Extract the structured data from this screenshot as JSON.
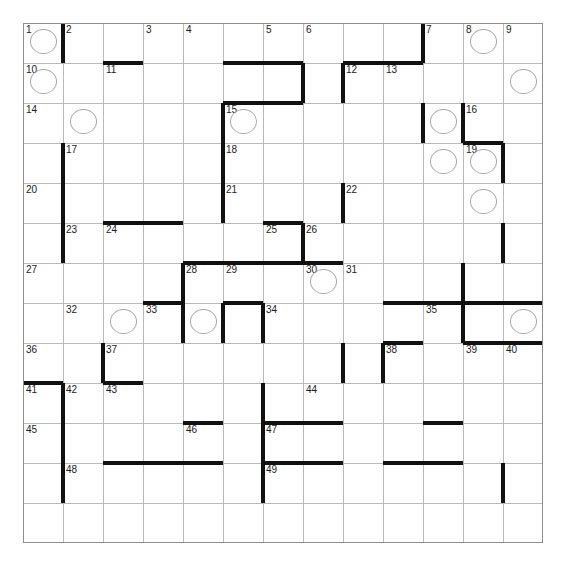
{
  "page": {
    "top_clipped_text": ""
  },
  "grid": {
    "columns": 13,
    "rows": 13,
    "cell_size": 40,
    "origin_x": 23,
    "origin_y": 23,
    "line_color": "#b9b9b9",
    "border_color": "#8d8d8d",
    "wall_color": "#111111",
    "circle_color": "#a8a8a8",
    "number_color": "#1a1a1a",
    "background": "#ffffff"
  },
  "numbers": [
    {
      "n": "1",
      "col": 0,
      "row": 0
    },
    {
      "n": "2",
      "col": 1,
      "row": 0
    },
    {
      "n": "3",
      "col": 3,
      "row": 0
    },
    {
      "n": "4",
      "col": 4,
      "row": 0
    },
    {
      "n": "5",
      "col": 6,
      "row": 0
    },
    {
      "n": "6",
      "col": 7,
      "row": 0
    },
    {
      "n": "7",
      "col": 10,
      "row": 0
    },
    {
      "n": "8",
      "col": 11,
      "row": 0
    },
    {
      "n": "9",
      "col": 12,
      "row": 0
    },
    {
      "n": "10",
      "col": 0,
      "row": 1
    },
    {
      "n": "11",
      "col": 2,
      "row": 1
    },
    {
      "n": "12",
      "col": 8,
      "row": 1
    },
    {
      "n": "13",
      "col": 9,
      "row": 1
    },
    {
      "n": "14",
      "col": 0,
      "row": 2
    },
    {
      "n": "15",
      "col": 5,
      "row": 2
    },
    {
      "n": "16",
      "col": 11,
      "row": 2
    },
    {
      "n": "17",
      "col": 1,
      "row": 3
    },
    {
      "n": "18",
      "col": 5,
      "row": 3
    },
    {
      "n": "19",
      "col": 11,
      "row": 3
    },
    {
      "n": "20",
      "col": 0,
      "row": 4
    },
    {
      "n": "21",
      "col": 5,
      "row": 4
    },
    {
      "n": "22",
      "col": 8,
      "row": 4
    },
    {
      "n": "23",
      "col": 1,
      "row": 5
    },
    {
      "n": "24",
      "col": 2,
      "row": 5
    },
    {
      "n": "25",
      "col": 6,
      "row": 5
    },
    {
      "n": "26",
      "col": 7,
      "row": 5
    },
    {
      "n": "27",
      "col": 0,
      "row": 6
    },
    {
      "n": "28",
      "col": 4,
      "row": 6
    },
    {
      "n": "29",
      "col": 5,
      "row": 6
    },
    {
      "n": "30",
      "col": 7,
      "row": 6
    },
    {
      "n": "31",
      "col": 8,
      "row": 6
    },
    {
      "n": "32",
      "col": 1,
      "row": 7
    },
    {
      "n": "33",
      "col": 3,
      "row": 7
    },
    {
      "n": "34",
      "col": 6,
      "row": 7
    },
    {
      "n": "35",
      "col": 10,
      "row": 7
    },
    {
      "n": "36",
      "col": 0,
      "row": 8
    },
    {
      "n": "37",
      "col": 2,
      "row": 8
    },
    {
      "n": "38",
      "col": 9,
      "row": 8
    },
    {
      "n": "39",
      "col": 11,
      "row": 8
    },
    {
      "n": "40",
      "col": 12,
      "row": 8
    },
    {
      "n": "41",
      "col": 0,
      "row": 9
    },
    {
      "n": "42",
      "col": 1,
      "row": 9
    },
    {
      "n": "43",
      "col": 2,
      "row": 9
    },
    {
      "n": "44",
      "col": 7,
      "row": 9
    },
    {
      "n": "45",
      "col": 0,
      "row": 10
    },
    {
      "n": "46",
      "col": 4,
      "row": 10
    },
    {
      "n": "47",
      "col": 6,
      "row": 10
    },
    {
      "n": "48",
      "col": 1,
      "row": 11
    },
    {
      "n": "49",
      "col": 6,
      "row": 11
    }
  ],
  "circles": [
    {
      "col": 0,
      "row": 0
    },
    {
      "col": 11,
      "row": 0
    },
    {
      "col": 0,
      "row": 1
    },
    {
      "col": 12,
      "row": 1
    },
    {
      "col": 1,
      "row": 2
    },
    {
      "col": 5,
      "row": 2
    },
    {
      "col": 10,
      "row": 2
    },
    {
      "col": 10,
      "row": 3
    },
    {
      "col": 11,
      "row": 3
    },
    {
      "col": 11,
      "row": 4
    },
    {
      "col": 7,
      "row": 6
    },
    {
      "col": 2,
      "row": 7
    },
    {
      "col": 4,
      "row": 7
    },
    {
      "col": 12,
      "row": 7
    }
  ],
  "walls_vertical": [
    {
      "col": 1,
      "row": 0
    },
    {
      "col": 10,
      "row": 0
    },
    {
      "col": 7,
      "row": 1
    },
    {
      "col": 8,
      "row": 1
    },
    {
      "col": 5,
      "row": 2
    },
    {
      "col": 10,
      "row": 2
    },
    {
      "col": 11,
      "row": 2
    },
    {
      "col": 1,
      "row": 3
    },
    {
      "col": 5,
      "row": 3
    },
    {
      "col": 12,
      "row": 3
    },
    {
      "col": 1,
      "row": 4
    },
    {
      "col": 5,
      "row": 4
    },
    {
      "col": 8,
      "row": 4
    },
    {
      "col": 1,
      "row": 5
    },
    {
      "col": 7,
      "row": 5
    },
    {
      "col": 12,
      "row": 5
    },
    {
      "col": 4,
      "row": 6
    },
    {
      "col": 11,
      "row": 6
    },
    {
      "col": 4,
      "row": 7
    },
    {
      "col": 6,
      "row": 7
    },
    {
      "col": 5,
      "row": 7
    },
    {
      "col": 11,
      "row": 7
    },
    {
      "col": 2,
      "row": 8
    },
    {
      "col": 9,
      "row": 8
    },
    {
      "col": 8,
      "row": 8
    },
    {
      "col": 1,
      "row": 9
    },
    {
      "col": 6,
      "row": 9
    },
    {
      "col": 1,
      "row": 10
    },
    {
      "col": 6,
      "row": 10
    },
    {
      "col": 1,
      "row": 11
    },
    {
      "col": 6,
      "row": 11
    },
    {
      "col": 12,
      "row": 11
    }
  ],
  "walls_horizontal": [
    {
      "col": 2,
      "row": 1
    },
    {
      "col": 5,
      "row": 1
    },
    {
      "col": 6,
      "row": 1
    },
    {
      "col": 8,
      "row": 1
    },
    {
      "col": 9,
      "row": 1
    },
    {
      "col": 5,
      "row": 2
    },
    {
      "col": 6,
      "row": 2
    },
    {
      "col": 11,
      "row": 3
    },
    {
      "col": 2,
      "row": 5
    },
    {
      "col": 3,
      "row": 5
    },
    {
      "col": 6,
      "row": 5
    },
    {
      "col": 7,
      "row": 6
    },
    {
      "col": 5,
      "row": 6
    },
    {
      "col": 6,
      "row": 6
    },
    {
      "col": 4,
      "row": 6
    },
    {
      "col": 5,
      "row": 7
    },
    {
      "col": 3,
      "row": 7
    },
    {
      "col": 9,
      "row": 7
    },
    {
      "col": 10,
      "row": 7
    },
    {
      "col": 11,
      "row": 7
    },
    {
      "col": 12,
      "row": 7
    },
    {
      "col": 9,
      "row": 8
    },
    {
      "col": 11,
      "row": 8
    },
    {
      "col": 12,
      "row": 8
    },
    {
      "col": 0,
      "row": 9
    },
    {
      "col": 2,
      "row": 9
    },
    {
      "col": 6,
      "row": 10
    },
    {
      "col": 7,
      "row": 10
    },
    {
      "col": 4,
      "row": 10
    },
    {
      "col": 10,
      "row": 10
    },
    {
      "col": 4,
      "row": 11
    },
    {
      "col": 6,
      "row": 11
    },
    {
      "col": 7,
      "row": 11
    },
    {
      "col": 3,
      "row": 11
    },
    {
      "col": 9,
      "row": 11
    },
    {
      "col": 10,
      "row": 11
    },
    {
      "col": 2,
      "row": 11
    }
  ]
}
